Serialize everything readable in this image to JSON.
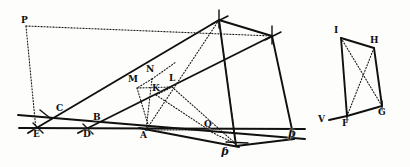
{
  "figure": {
    "background_color": "#fdfdfb",
    "ink_color": "#101010",
    "canvas": {
      "width": 410,
      "height": 167
    },
    "labels": [
      {
        "id": "P",
        "text": "P",
        "x": 21,
        "y": 16,
        "style": "roman"
      },
      {
        "id": "C",
        "text": "C",
        "x": 56,
        "y": 108,
        "style": "roman"
      },
      {
        "id": "E",
        "text": "E",
        "x": 36,
        "y": 134,
        "style": "roman"
      },
      {
        "id": "D",
        "text": "D",
        "x": 85,
        "y": 135,
        "style": "roman"
      },
      {
        "id": "B",
        "text": "B",
        "x": 95,
        "y": 118,
        "style": "roman"
      },
      {
        "id": "A",
        "text": "A",
        "x": 142,
        "y": 136,
        "style": "roman"
      },
      {
        "id": "M",
        "text": "M",
        "x": 131,
        "y": 80,
        "style": "roman"
      },
      {
        "id": "N",
        "text": "N",
        "x": 148,
        "y": 70,
        "style": "roman"
      },
      {
        "id": "K",
        "text": "K",
        "x": 153,
        "y": 88,
        "style": "roman"
      },
      {
        "id": "L",
        "text": "L",
        "x": 170,
        "y": 79,
        "style": "roman"
      },
      {
        "id": "Q",
        "text": "Q",
        "x": 205,
        "y": 124,
        "style": "roman"
      },
      {
        "id": "R",
        "text": "ƥ",
        "x": 288,
        "y": 135,
        "style": "script"
      },
      {
        "id": "S",
        "text": "ƥ",
        "x": 222,
        "y": 148,
        "style": "script"
      },
      {
        "id": "I",
        "text": "I",
        "x": 336,
        "y": 29,
        "style": "roman"
      },
      {
        "id": "H",
        "text": "H",
        "x": 372,
        "y": 39,
        "style": "roman"
      },
      {
        "id": "V",
        "text": "V",
        "x": 322,
        "y": 117,
        "style": "roman"
      },
      {
        "id": "F",
        "text": "F",
        "x": 341,
        "y": 122,
        "style": "roman"
      },
      {
        "id": "G",
        "text": "G",
        "x": 379,
        "y": 113,
        "style": "roman"
      }
    ],
    "points": {
      "P": {
        "x": 26,
        "y": 26
      },
      "E": {
        "x": 38,
        "y": 128
      },
      "C": {
        "x": 60,
        "y": 116
      },
      "D": {
        "x": 88,
        "y": 129
      },
      "B": {
        "x": 98,
        "y": 125
      },
      "A": {
        "x": 146,
        "y": 130
      },
      "M": {
        "x": 137,
        "y": 88
      },
      "N": {
        "x": 152,
        "y": 79
      },
      "K": {
        "x": 156,
        "y": 95
      },
      "L": {
        "x": 172,
        "y": 87
      },
      "Q": {
        "x": 209,
        "y": 131
      },
      "T": {
        "x": 219,
        "y": 20
      },
      "U": {
        "x": 272,
        "y": 36
      },
      "S": {
        "x": 236,
        "y": 144
      },
      "R": {
        "x": 294,
        "y": 138
      },
      "W": {
        "x": 19,
        "y": 117
      },
      "X": {
        "x": 305,
        "y": 130
      },
      "I": {
        "x": 341,
        "y": 38
      },
      "H": {
        "x": 374,
        "y": 48
      },
      "F": {
        "x": 347,
        "y": 116
      },
      "G": {
        "x": 382,
        "y": 106
      },
      "V": {
        "x": 331,
        "y": 120
      }
    },
    "solid_segments": [
      {
        "name": "baseline-E-R",
        "from": "W",
        "to": "X"
      },
      {
        "name": "line-E-to-T",
        "from": "E",
        "to": "T"
      },
      {
        "name": "line-D-to-U",
        "from": "D",
        "to": "U"
      },
      {
        "name": "line-C-to-Q",
        "from": "C",
        "to": "X"
      },
      {
        "name": "side-T-to-U",
        "from": "T",
        "to": "U"
      },
      {
        "name": "side-T-to-S",
        "from": "T",
        "to": "S"
      },
      {
        "name": "side-U-to-R",
        "from": "U",
        "to": "R"
      },
      {
        "name": "side-S-to-R",
        "from": "S",
        "to": "R"
      },
      {
        "name": "side-A-to-S",
        "from": "A",
        "to": "S"
      },
      {
        "name": "quad-I-to-H",
        "from": "I",
        "to": "H"
      },
      {
        "name": "quad-I-to-F",
        "from": "I",
        "to": "F"
      },
      {
        "name": "quad-H-to-G",
        "from": "H",
        "to": "G"
      },
      {
        "name": "quad-F-to-G",
        "from": "F",
        "to": "G"
      },
      {
        "name": "quad-V-to-F",
        "from": "V",
        "to": "F"
      }
    ],
    "dotted_segments": [
      {
        "name": "dotted-P-to-U",
        "from": "P",
        "to": "U"
      },
      {
        "name": "dotted-P-to-E",
        "from": "P",
        "to": "E"
      },
      {
        "name": "dotted-T-to-A",
        "from": "T",
        "to": "A"
      },
      {
        "name": "dotted-A-to-Q",
        "from": "A",
        "to": "Q"
      },
      {
        "name": "dotted-A-to-N",
        "from": "A",
        "to": "N"
      },
      {
        "name": "dotted-M-to-L",
        "from": "M",
        "to": "L"
      },
      {
        "name": "dotted-N-to-K",
        "from": "N",
        "to": "K"
      },
      {
        "name": "dotted-K-to-Q",
        "from": "K",
        "to": "Q"
      },
      {
        "name": "dotted-L-to-X",
        "from": "L",
        "to": "X"
      },
      {
        "name": "dotted-M-to-A",
        "from": "M",
        "to": "A"
      },
      {
        "name": "dotted-S-to-U",
        "from": "S",
        "to": "U"
      },
      {
        "name": "dotted-I-to-G",
        "from": "I",
        "to": "G"
      },
      {
        "name": "dotted-H-to-F",
        "from": "H",
        "to": "F"
      }
    ],
    "tick_marks": [
      {
        "name": "tick-at-E",
        "x": 38,
        "y": 128,
        "angle": 115
      },
      {
        "name": "tick-at-D",
        "x": 88,
        "y": 129,
        "angle": 115
      },
      {
        "name": "tick-at-C",
        "x": 45,
        "y": 113,
        "angle": 115
      },
      {
        "name": "tick-at-T",
        "x": 219,
        "y": 20,
        "angle": 100
      },
      {
        "name": "tick-at-U",
        "x": 272,
        "y": 36,
        "angle": 100
      },
      {
        "name": "tick-at-S",
        "x": 236,
        "y": 144,
        "angle": 100
      }
    ]
  }
}
